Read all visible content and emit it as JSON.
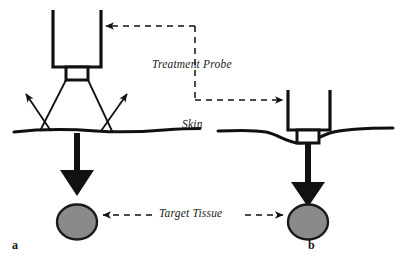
{
  "figure": {
    "type": "medical-device-diagram",
    "width": 407,
    "height": 266,
    "background_color": "#ffffff",
    "line_color": "#111111",
    "tissue_fill_color": "#8a8a8a",
    "tissue_stroke_color": "#1a1a1a"
  },
  "labels": {
    "treatment_probe": "Treatment Probe",
    "skin": "Skin",
    "target_tissue": "Target Tissue",
    "panel_a": "a",
    "panel_b": "b"
  },
  "panels": [
    {
      "id": "a",
      "label": "a",
      "description": "Probe held at skin surface, energy beam diverges and scatters",
      "probe_contact": "light",
      "beam": "divergent",
      "reaches_target": false
    },
    {
      "id": "b",
      "label": "b",
      "description": "Probe pressed into skin, energy beam focused onto target tissue",
      "probe_contact": "compressed",
      "beam": "focused",
      "reaches_target": true
    }
  ],
  "annotations": {
    "probe_leader": "dashed leader from Treatment Probe label to both probe bodies",
    "tissue_leader": "dashed leader from Target Tissue label to both target tissues"
  }
}
